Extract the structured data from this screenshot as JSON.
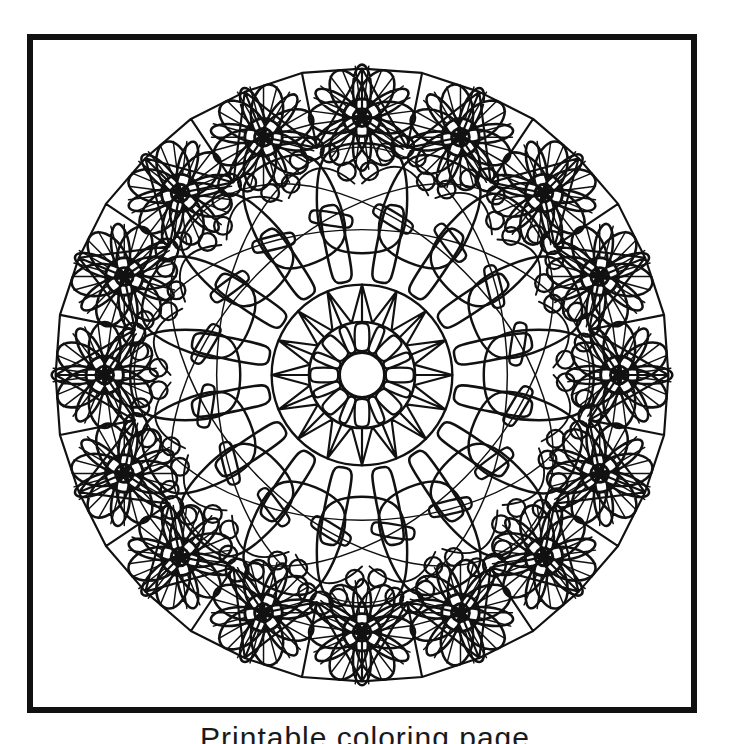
{
  "page": {
    "background_color": "#ffffff",
    "width": 730,
    "height": 744
  },
  "frame": {
    "border_color": "#111111",
    "border_width_px": 6,
    "fill_color": "#ffffff"
  },
  "caption": {
    "text": "Printable coloring page",
    "note": "text clipped at bottom edge of screenshot"
  },
  "artwork": {
    "title": "Floral Mandala Coloring Page",
    "style": "black line art, white fill",
    "line_color": "#111111",
    "center_x": 335,
    "center_y": 341,
    "outer_radius": 318,
    "outer_flower_count": 16,
    "outer_flower_radius_from_center": 262,
    "flower": {
      "petal_count": 12,
      "outer_petal_radius": 54,
      "hub_outer_radius": 19,
      "hub_inner_radius": 9
    },
    "polygon_web": {
      "vertex_count": 16,
      "radius": 312
    },
    "mid_ring": {
      "lobe_count": 16,
      "lobe_radius": 180,
      "bead_clusters": 16,
      "beads_per_cluster": 5,
      "bead_radius": 11
    },
    "spike_ring": {
      "spike_count": 16,
      "inner_radius": 96,
      "outer_radius": 176,
      "lozenge_width": 11
    },
    "core": {
      "ring_radius": 92,
      "star_points": 16,
      "inner_ring_radius": 54,
      "center_circle_radius": 23
    }
  },
  "chart_data": {
    "type": "diagram",
    "symmetry_order": 16,
    "rings": [
      {
        "name": "outer-polygon-web",
        "radius": 312,
        "elements": 16,
        "shape": "polygon-facets"
      },
      {
        "name": "outer-flower-ring",
        "radius": 262,
        "elements": 16,
        "shape": "12-petal-flower"
      },
      {
        "name": "bead-arc-ring",
        "radius": 215,
        "elements": 16,
        "shape": "circle-cluster"
      },
      {
        "name": "lobe-ring",
        "radius": 180,
        "elements": 16,
        "shape": "teardrop-lobe"
      },
      {
        "name": "spike-ring",
        "radius": 136,
        "elements": 16,
        "shape": "lozenge-spike"
      },
      {
        "name": "core-star",
        "radius": 92,
        "elements": 16,
        "shape": "triangle-star"
      },
      {
        "name": "core-petal-ring",
        "radius": 54,
        "elements": 16,
        "shape": "petal"
      },
      {
        "name": "center-disc",
        "radius": 23,
        "elements": 1,
        "shape": "circle"
      }
    ]
  }
}
